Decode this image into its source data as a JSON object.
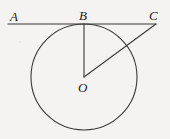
{
  "figure": {
    "width": 170,
    "height": 139,
    "background_color": "#f4f3f1",
    "stroke_color": "#3a3a3a",
    "label_color": "#1c1c1c"
  },
  "labels": {
    "a": "A",
    "b": "B",
    "c": "C",
    "o": "O"
  },
  "geometry": {
    "circle": {
      "cx": 84,
      "cy": 77,
      "r": 53
    },
    "tangent_line": {
      "x1": 8,
      "y1": 24,
      "x2": 156,
      "y2": 24
    },
    "radius_ob": {
      "x1": 84,
      "y1": 24,
      "x2": 84,
      "y2": 77
    },
    "segment_oc": {
      "x1": 84,
      "y1": 77,
      "x2": 156,
      "y2": 24
    },
    "points": {
      "a": {
        "x": 14,
        "y": 24
      },
      "b": {
        "x": 84,
        "y": 24
      },
      "c": {
        "x": 156,
        "y": 24
      },
      "o": {
        "x": 84,
        "y": 77
      }
    }
  },
  "label_positions": {
    "a": {
      "left": 10,
      "top": 10
    },
    "b": {
      "left": 79,
      "top": 9
    },
    "c": {
      "left": 149,
      "top": 9
    },
    "o": {
      "left": 78,
      "top": 81
    }
  }
}
